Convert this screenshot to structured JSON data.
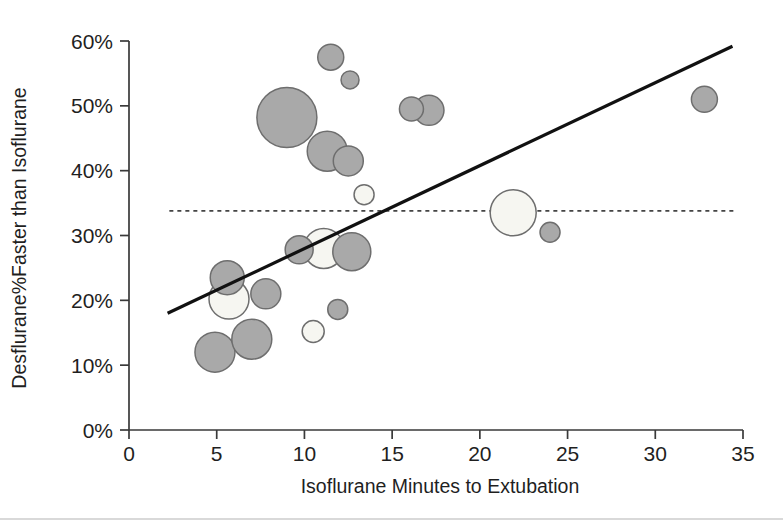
{
  "chart_data": {
    "type": "scatter",
    "title": "",
    "subtitle": "",
    "xlabel": "Isoflurane Minutes to Extubation",
    "ylabel": "Desflurane%Faster than Isoflurane",
    "xlim": [
      0,
      35
    ],
    "ylim": [
      0,
      60
    ],
    "xticks": [
      0,
      5,
      10,
      15,
      20,
      25,
      30,
      35
    ],
    "xtick_labels": [
      "0",
      "5",
      "10",
      "15",
      "20",
      "25",
      "30",
      "35"
    ],
    "yticks": [
      0,
      10,
      20,
      30,
      40,
      50,
      60
    ],
    "ytick_labels": [
      "0%",
      "10%",
      "20%",
      "30%",
      "40%",
      "50%",
      "60%"
    ],
    "grid": false,
    "legend": null,
    "marker_style": "bubble",
    "note": "Bubble area encodes study weight / sample size. Gray bubbles and open (white) bubbles are both plotted.",
    "colors": {
      "bubble_gray_fill": "#a9a9a9",
      "bubble_white_fill": "#f6f6f1",
      "bubble_stroke": "#6e6e6e",
      "trend_line": "#111111",
      "mean_line": "#444444",
      "axis": "#3a3a3a",
      "text": "#1f1f1f",
      "background": "#ffffff"
    },
    "points": [
      {
        "x": 4.9,
        "y": 12.0,
        "r": 20,
        "fill": "gray"
      },
      {
        "x": 5.6,
        "y": 23.5,
        "r": 17,
        "fill": "gray"
      },
      {
        "x": 5.7,
        "y": 20.2,
        "r": 20,
        "fill": "white"
      },
      {
        "x": 7.0,
        "y": 14.0,
        "r": 20,
        "fill": "gray"
      },
      {
        "x": 7.8,
        "y": 21.0,
        "r": 15,
        "fill": "gray"
      },
      {
        "x": 9.0,
        "y": 48.2,
        "r": 30,
        "fill": "gray"
      },
      {
        "x": 9.7,
        "y": 27.8,
        "r": 14,
        "fill": "gray"
      },
      {
        "x": 10.5,
        "y": 15.2,
        "r": 11,
        "fill": "white"
      },
      {
        "x": 11.1,
        "y": 28.0,
        "r": 20,
        "fill": "white"
      },
      {
        "x": 11.3,
        "y": 43.0,
        "r": 20,
        "fill": "gray"
      },
      {
        "x": 11.5,
        "y": 57.5,
        "r": 13,
        "fill": "gray"
      },
      {
        "x": 11.9,
        "y": 18.6,
        "r": 10,
        "fill": "gray"
      },
      {
        "x": 12.5,
        "y": 41.5,
        "r": 15,
        "fill": "gray"
      },
      {
        "x": 12.6,
        "y": 54.0,
        "r": 9,
        "fill": "gray"
      },
      {
        "x": 12.7,
        "y": 27.5,
        "r": 19,
        "fill": "gray"
      },
      {
        "x": 13.4,
        "y": 36.3,
        "r": 10,
        "fill": "white"
      },
      {
        "x": 16.1,
        "y": 49.5,
        "r": 12,
        "fill": "gray"
      },
      {
        "x": 17.1,
        "y": 49.3,
        "r": 15,
        "fill": "gray"
      },
      {
        "x": 21.9,
        "y": 33.5,
        "r": 23,
        "fill": "white"
      },
      {
        "x": 24.0,
        "y": 30.5,
        "r": 10,
        "fill": "gray"
      },
      {
        "x": 32.8,
        "y": 51.0,
        "r": 13,
        "fill": "gray"
      }
    ],
    "trend_line": {
      "label": "regression line",
      "x_start": 2.2,
      "y_start": 18.0,
      "x_end": 34.4,
      "y_end": 59.2
    },
    "mean_line": {
      "label": "pooled mean",
      "y": 33.8,
      "x_start": 2.3,
      "x_end": 34.6,
      "style": "dashed"
    }
  }
}
